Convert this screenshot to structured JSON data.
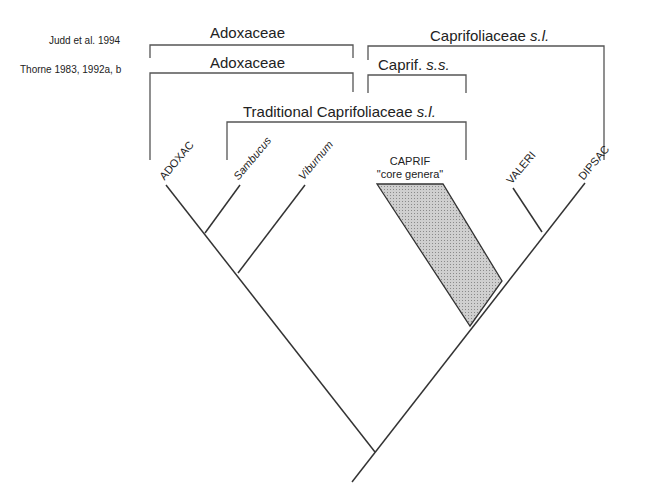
{
  "sources": {
    "judd": "Judd et al. 1994",
    "thorne": "Thorne 1983, 1992a, b"
  },
  "groups": {
    "judd_adox": "Adoxaceae",
    "judd_caprif_main": "Caprifoliaceae ",
    "judd_caprif_it": "s.l.",
    "thorne_adox": "Adoxaceae",
    "thorne_caprif_main": "Caprif. ",
    "thorne_caprif_it": "s.s.",
    "trad_main": "Traditional Caprifoliaceae ",
    "trad_it": "s.l."
  },
  "tips": {
    "adoxac": "ADOXAC",
    "sambucus": "Sambucus",
    "viburnum": "Viburnum",
    "caprif": "CAPRIF",
    "caprif_sub": "\"core genera\"",
    "valeri": "VALERI",
    "dipsac": "DIPSAC"
  },
  "colors": {
    "line": "#333333",
    "bracket": "#555555",
    "shade": "#bdbdbd"
  }
}
